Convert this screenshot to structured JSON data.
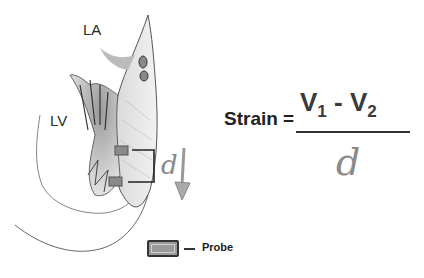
{
  "figure": {
    "labels": {
      "left_atrium": "LA",
      "left_ventricle": "LV",
      "distance": "d"
    },
    "formula": {
      "lhs": "Strain =",
      "numerator": {
        "v1": "V",
        "v1_sub": "1",
        "minus": " - ",
        "v2": "V",
        "v2_sub": "2"
      },
      "denominator": "d"
    },
    "legend": {
      "probe_label": "Probe"
    },
    "colors": {
      "probe_fill": "#9a9a9a",
      "probe_border": "#333333",
      "text": "#222222",
      "d_symbol": "#888888"
    }
  }
}
